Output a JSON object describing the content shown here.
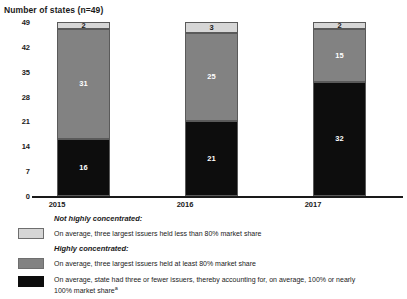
{
  "chart_data": {
    "type": "bar",
    "subtype": "stacked-vertical",
    "title": "Number of states (n=49)",
    "xlabel": "",
    "ylabel": "Number of states (n=49)",
    "ylim": [
      0,
      49
    ],
    "yticks": [
      0,
      7,
      14,
      21,
      28,
      35,
      42,
      49
    ],
    "grid": false,
    "legend_position": "below",
    "categories": [
      "2015",
      "2016",
      "2017"
    ],
    "series": [
      {
        "name": "On average, state had three or fewer issuers, thereby accounting for, on average, 100% or nearly 100% market share",
        "group": "Highly concentrated:",
        "color": "#0d0d0d",
        "values": [
          16,
          21,
          32
        ]
      },
      {
        "name": "On average, three largest issuers held at least 80% market share",
        "group": "Highly concentrated:",
        "color": "#828282",
        "values": [
          31,
          25,
          15
        ]
      },
      {
        "name": "On average, three largest issuers held less than 80% market share",
        "group": "Not highly concentrated:",
        "color": "#d6d6d6",
        "values": [
          2,
          3,
          2
        ]
      }
    ],
    "totals": [
      49,
      49,
      49
    ]
  },
  "axis": {
    "title": "Number of states (n=49)",
    "yticks": [
      "49",
      "42",
      "35",
      "28",
      "21",
      "14",
      "7",
      "0"
    ],
    "xticks": [
      "2015",
      "2016",
      "2017"
    ]
  },
  "bars": [
    {
      "category": "2015",
      "segments": [
        {
          "label": "2",
          "value": 2,
          "tone": "light"
        },
        {
          "label": "31",
          "value": 31,
          "tone": "mid"
        },
        {
          "label": "16",
          "value": 16,
          "tone": "dark"
        }
      ]
    },
    {
      "category": "2016",
      "segments": [
        {
          "label": "3",
          "value": 3,
          "tone": "light"
        },
        {
          "label": "25",
          "value": 25,
          "tone": "mid"
        },
        {
          "label": "21",
          "value": 21,
          "tone": "dark"
        }
      ]
    },
    {
      "category": "2017",
      "segments": [
        {
          "label": "2",
          "value": 2,
          "tone": "light"
        },
        {
          "label": "15",
          "value": 15,
          "tone": "mid"
        },
        {
          "label": "32",
          "value": 32,
          "tone": "dark"
        }
      ]
    }
  ],
  "legend": {
    "group_not_concentrated": "Not highly concentrated:",
    "group_highly_concentrated": "Highly concentrated:",
    "item_light": "On average, three largest issuers held less than 80% market share",
    "item_mid": "On average, three largest issuers held at least 80% market share",
    "item_dark_line1": "On average, state had three or fewer issuers, thereby accounting for, on average, 100% or nearly",
    "item_dark_line2": "100% market share",
    "item_dark_footnote": "a"
  },
  "colors": {
    "light": "#d6d6d6",
    "mid": "#828282",
    "dark": "#0d0d0d",
    "axis": "#1a1a1a",
    "background": "#ffffff"
  }
}
